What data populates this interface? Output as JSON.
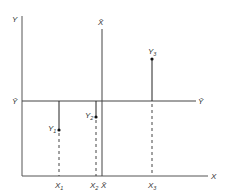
{
  "diagram": {
    "type": "scatter-deviation-diagram",
    "axes": {
      "y_label": "Y",
      "x_label": "X",
      "y_mean_label": "Ȳ",
      "x_mean_label": "X̄"
    },
    "points": [
      {
        "label": "Y",
        "sub": "1",
        "x_label": "X",
        "x_sub": "1"
      },
      {
        "label": "Y",
        "sub": "2",
        "x_label": "X",
        "x_sub": "2"
      },
      {
        "label": "Y",
        "sub": "3",
        "x_label": "X",
        "x_sub": "3"
      }
    ],
    "colors": {
      "line": "#333333",
      "background": "#ffffff"
    }
  }
}
